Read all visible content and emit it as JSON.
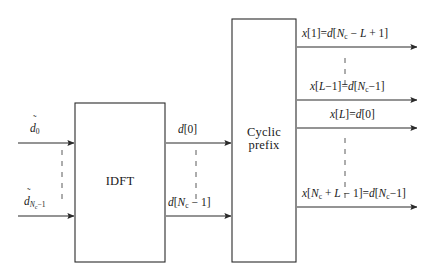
{
  "figure": {
    "type": "block-diagram",
    "background_color": "#ffffff",
    "line_color": "#2b2b2b",
    "text_color": "#1a1a1a"
  },
  "blocks": [
    {
      "id": "idft",
      "label": "IDFT",
      "x": 75,
      "y": 103,
      "width": 90,
      "height": 159
    },
    {
      "id": "cyclic_prefix",
      "label_line1": "Cyclic",
      "label_line2": "prefix",
      "x": 232,
      "y": 19,
      "width": 64,
      "height": 243
    }
  ],
  "inputs": {
    "top": {
      "base": "d",
      "accent": "~",
      "subscript": "0",
      "text": "d̃0"
    },
    "bottom": {
      "base": "d",
      "accent": "~",
      "subscript": "Nc−1",
      "text": "d̃Nc−1"
    },
    "vertical_ellipsis": "dashed"
  },
  "intermediate": {
    "top": {
      "prefix": "d",
      "bracket": "[0]",
      "text": "d[0]"
    },
    "bottom": {
      "prefix": "d",
      "bracket_open": "[",
      "sub_main": "N",
      "sub_small": "c",
      "bracket_rest": " − 1]",
      "text": "d[Nc − 1]"
    },
    "vertical_ellipsis": "dashed"
  },
  "outputs": [
    {
      "id": "out1",
      "y": 47,
      "lhs_var": "x",
      "lhs_index": "[1]",
      "eq": "=",
      "rhs_var": "d",
      "rhs_index": "[Nc − L + 1]",
      "text": "x[1] = d[Nc − L + 1]"
    },
    {
      "id": "out2",
      "y": 100,
      "lhs_var": "x",
      "lhs_index": "[L−1]",
      "eq": "=",
      "rhs_var": "d",
      "rhs_index": "[Nc −1]",
      "text": "x[L−1] = d[Nc −1]"
    },
    {
      "id": "out3",
      "y": 128,
      "lhs_var": "x",
      "lhs_index": "[L]",
      "eq": "=",
      "rhs_var": "d",
      "rhs_index": "[0]",
      "text": "x[L] = d[0]"
    },
    {
      "id": "out4",
      "y": 207,
      "lhs_var": "x",
      "lhs_index": "[Nc + L − 1]",
      "eq": "=",
      "rhs_var": "d",
      "rhs_index": "[Nc − 1]",
      "text": "x[Nc + L − 1] = d[Nc −1]"
    }
  ],
  "ellipses": [
    {
      "id": "input-ellipsis",
      "x": 62,
      "y_start": 150,
      "y_end": 196,
      "style": "dashed-vertical"
    },
    {
      "id": "intermediate-ellipsis",
      "x": 196,
      "y_start": 150,
      "y_end": 196,
      "style": "dashed-vertical"
    },
    {
      "id": "output-ellipsis-upper",
      "x": 345,
      "y_start": 60,
      "y_end": 88,
      "style": "dashed-vertical"
    },
    {
      "id": "output-ellipsis-lower",
      "x": 345,
      "y_start": 140,
      "y_end": 196,
      "style": "dashed-vertical"
    }
  ],
  "symbols": {
    "tilde": "̃",
    "minus": "−",
    "plus": "+",
    "equals": "="
  }
}
